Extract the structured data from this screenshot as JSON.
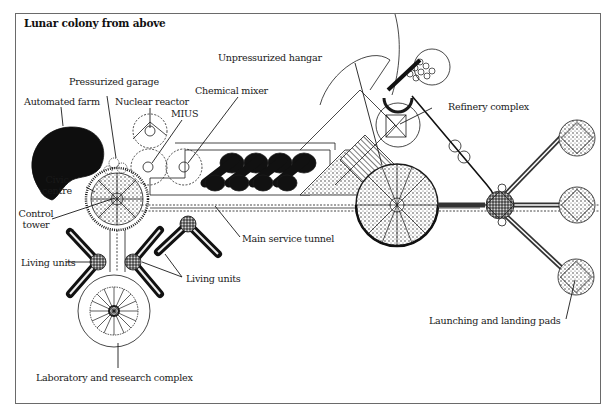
{
  "title": "Lunar colony from above",
  "labels": {
    "automated_farm": "Automated farm",
    "pressurized_garage": "Pressurized garage",
    "nuclear_reactor": "Nuclear reactor",
    "mius": "MIUS",
    "chemical_mixer": "Chemical mixer",
    "unpressurized_hangar": "Unpressurized hangar",
    "refinery_complex": "Refinery complex",
    "civic_centre_line1": "Civic",
    "civic_centre_line2": "centre",
    "control_tower_line1": "Control",
    "control_tower_line2": "tower",
    "main_service_tunnel": "Main service tunnel",
    "living_units_left": "Living units",
    "living_units_right": "Living units",
    "laboratory": "Laboratory and research complex",
    "launch_pads": "Launching and landing pads"
  },
  "colors": {
    "ink": "#1a1a1a",
    "frame": "#6a6a6a",
    "background": "#ffffff",
    "fill_dark": "#111111",
    "fill_mid": "#555555"
  }
}
